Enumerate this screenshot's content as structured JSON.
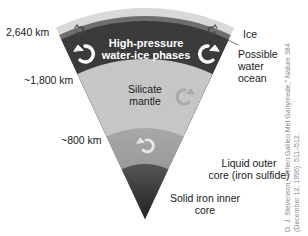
{
  "diagram": {
    "layers": [
      {
        "id": "ice",
        "label": "Ice",
        "color": "#d8d8d8"
      },
      {
        "id": "water-ocean",
        "label": "Possible water ocean",
        "color": "#6a6a6a"
      },
      {
        "id": "high-pressure-ice",
        "label": "High-pressure water-ice phases",
        "label_lines": [
          "High-pressure",
          "water-ice phases"
        ],
        "color": "#3a3a3a"
      },
      {
        "id": "silicate-mantle",
        "label": "Silicate mantle",
        "label_lines": [
          "Silicate",
          "mantle"
        ],
        "color": "#c4c4c4"
      },
      {
        "id": "outer-core",
        "label": "Liquid outer core (iron sulfide)",
        "label_lines": [
          "Liquid outer",
          "core (iron sulfide)"
        ],
        "color": "#9a9a9a"
      },
      {
        "id": "inner-core",
        "label": "Solid iron inner core",
        "label_lines": [
          "Solid iron inner",
          "core"
        ],
        "color": "#2e2e2e"
      }
    ],
    "radius_markers": [
      {
        "label": "2,640 km"
      },
      {
        "label": "~1,800 km"
      },
      {
        "label": "~800 km"
      }
    ],
    "labels": {
      "ice": "Ice",
      "ocean_lines": [
        "Possible",
        "water",
        "ocean"
      ],
      "hp_ice_lines": [
        "High-pressure",
        "water-ice phases"
      ],
      "silicate_lines": [
        "Silicate",
        "mantle"
      ],
      "outer_core_lines": [
        "Liquid outer",
        "core (iron sulfide)"
      ],
      "inner_core_lines": [
        "Solid iron inner",
        "core"
      ]
    },
    "credit_lines": [
      "D. J. Stevenson, \"When Galileo Met Ganymede,\" Nature 384",
      "(December 12, 1996): 511–512."
    ],
    "icons": [
      "convection-arrow-icon"
    ]
  }
}
